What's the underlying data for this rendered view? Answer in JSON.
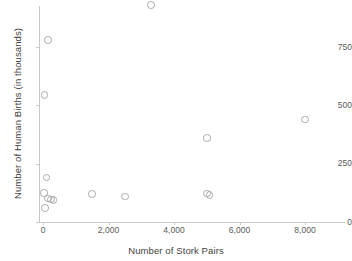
{
  "chart_data": {
    "type": "scatter",
    "title": "",
    "xlabel": "Number of Stork Pairs",
    "ylabel": "Number of Human Births (in thousands)",
    "xlim": [
      -300,
      8800
    ],
    "ylim": [
      0,
      960
    ],
    "xticks": [
      0,
      2000,
      4000,
      6000,
      8000
    ],
    "xticklabels": [
      "0",
      "2,000",
      "4,000",
      "6,000",
      "8,000"
    ],
    "yticks": [
      0,
      250,
      500,
      750
    ],
    "yticklabels": [
      "0",
      "250",
      "500",
      "750"
    ],
    "grid": false,
    "legend": null,
    "marker": "open-circle",
    "marker_color": "#a8a8a8",
    "points": [
      {
        "x": 3300,
        "y": 930
      },
      {
        "x": 150,
        "y": 780
      },
      {
        "x": 50,
        "y": 545
      },
      {
        "x": 8000,
        "y": 440
      },
      {
        "x": 5000,
        "y": 360
      },
      {
        "x": 100,
        "y": 190
      },
      {
        "x": 30,
        "y": 125
      },
      {
        "x": 1500,
        "y": 120
      },
      {
        "x": 5000,
        "y": 122
      },
      {
        "x": 5080,
        "y": 115
      },
      {
        "x": 2500,
        "y": 110
      },
      {
        "x": 150,
        "y": 100
      },
      {
        "x": 250,
        "y": 97
      },
      {
        "x": 320,
        "y": 95
      },
      {
        "x": 60,
        "y": 60
      }
    ]
  },
  "axes": {
    "x_title": "Number of Stork Pairs",
    "y_title": "Number of Human Births (in thousands)"
  },
  "colors": {
    "axis": "#c9c9c9",
    "tick_text": "#5a5a5a",
    "title_text": "#3f3f3f",
    "marker": "#a8a8a8",
    "background": "#ffffff"
  }
}
